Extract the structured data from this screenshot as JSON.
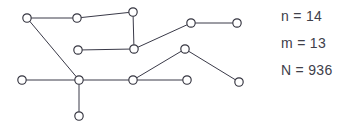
{
  "figure": {
    "type": "graph-diagram",
    "background_color": "#ffffff",
    "node_stroke_color": "#34343f",
    "node_fill_color": "#ffffff",
    "edge_color": "#3a3a48",
    "text_color": "#40404a"
  },
  "graph": {
    "node_radius": 4.2,
    "node_count": 14,
    "edge_count": 13,
    "nodes": [
      {
        "id": "n1",
        "x": 27,
        "y": 18
      },
      {
        "id": "n2",
        "x": 77,
        "y": 18
      },
      {
        "id": "n3",
        "x": 133,
        "y": 12
      },
      {
        "id": "n4",
        "x": 191,
        "y": 23
      },
      {
        "id": "n5",
        "x": 237,
        "y": 23
      },
      {
        "id": "n6",
        "x": 78,
        "y": 50
      },
      {
        "id": "n7",
        "x": 134,
        "y": 49
      },
      {
        "id": "n8",
        "x": 185,
        "y": 49
      },
      {
        "id": "n9",
        "x": 22,
        "y": 80
      },
      {
        "id": "n10",
        "x": 79,
        "y": 80
      },
      {
        "id": "n11",
        "x": 133,
        "y": 80
      },
      {
        "id": "n12",
        "x": 187,
        "y": 80
      },
      {
        "id": "n13",
        "x": 239,
        "y": 82
      },
      {
        "id": "n14",
        "x": 79,
        "y": 116
      }
    ],
    "edges": [
      {
        "from": "n1",
        "to": "n2"
      },
      {
        "from": "n2",
        "to": "n3"
      },
      {
        "from": "n3",
        "to": "n7"
      },
      {
        "from": "n6",
        "to": "n7"
      },
      {
        "from": "n7",
        "to": "n4"
      },
      {
        "from": "n4",
        "to": "n5"
      },
      {
        "from": "n1",
        "to": "n10"
      },
      {
        "from": "n9",
        "to": "n10"
      },
      {
        "from": "n10",
        "to": "n11"
      },
      {
        "from": "n10",
        "to": "n14"
      },
      {
        "from": "n11",
        "to": "n12"
      },
      {
        "from": "n11",
        "to": "n8"
      },
      {
        "from": "n8",
        "to": "n13"
      }
    ]
  },
  "stats": {
    "lines": [
      {
        "key": "n",
        "text": "n = 14"
      },
      {
        "key": "m",
        "text": "m = 13"
      },
      {
        "key": "N",
        "text": "N = 936"
      }
    ]
  }
}
